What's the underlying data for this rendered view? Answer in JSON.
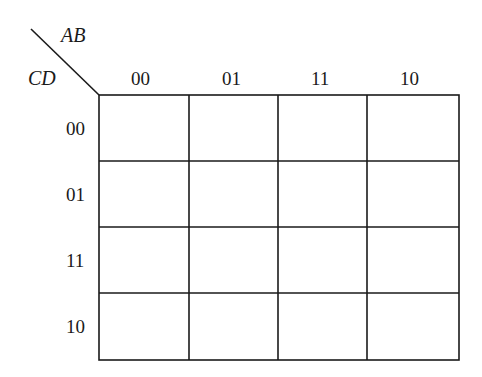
{
  "kmap": {
    "row_var": "CD",
    "col_var": "AB",
    "col_labels": [
      "00",
      "01",
      "11",
      "10"
    ],
    "row_labels": [
      "00",
      "01",
      "11",
      "10"
    ],
    "cells": [
      [
        "",
        "",
        "",
        ""
      ],
      [
        "",
        "",
        "",
        ""
      ],
      [
        "",
        "",
        "",
        ""
      ],
      [
        "",
        "",
        "",
        ""
      ]
    ]
  }
}
